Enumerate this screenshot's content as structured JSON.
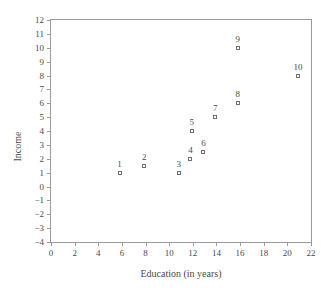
{
  "chart_data": {
    "type": "scatter",
    "title": "",
    "xlabel": "Education (in years)",
    "ylabel": "Income",
    "xlim": [
      0,
      22
    ],
    "ylim": [
      -4,
      12
    ],
    "xticks": [
      "0",
      "2",
      "4",
      "6",
      "8",
      "10",
      "12",
      "14",
      "16",
      "18",
      "20",
      "22"
    ],
    "xtick_values": [
      0,
      2,
      4,
      6,
      8,
      10,
      12,
      14,
      16,
      18,
      20,
      22
    ],
    "yticks": [
      "12",
      "11",
      "10",
      "9",
      "8",
      "7",
      "6",
      "5",
      "4",
      "3",
      "2",
      "1",
      "0",
      "−1",
      "−2",
      "−3",
      "−4"
    ],
    "ytick_values": [
      12,
      11,
      10,
      9,
      8,
      7,
      6,
      5,
      4,
      3,
      2,
      1,
      0,
      -1,
      -2,
      -3,
      -4
    ],
    "grid": false,
    "legend": false,
    "marker": "open-square",
    "marker_color": "#6f6f6f",
    "frame_color": "#9a9a9a",
    "points": [
      {
        "label": "1",
        "x": 5.8,
        "y": 1.0
      },
      {
        "label": "2",
        "x": 7.9,
        "y": 1.5
      },
      {
        "label": "3",
        "x": 10.8,
        "y": 1.0
      },
      {
        "label": "4",
        "x": 11.8,
        "y": 2.0
      },
      {
        "label": "5",
        "x": 11.9,
        "y": 4.0
      },
      {
        "label": "6",
        "x": 12.9,
        "y": 2.5
      },
      {
        "label": "7",
        "x": 13.9,
        "y": 5.0
      },
      {
        "label": "8",
        "x": 15.8,
        "y": 6.0
      },
      {
        "label": "9",
        "x": 15.8,
        "y": 10.0
      },
      {
        "label": "10",
        "x": 20.9,
        "y": 8.0
      }
    ]
  }
}
